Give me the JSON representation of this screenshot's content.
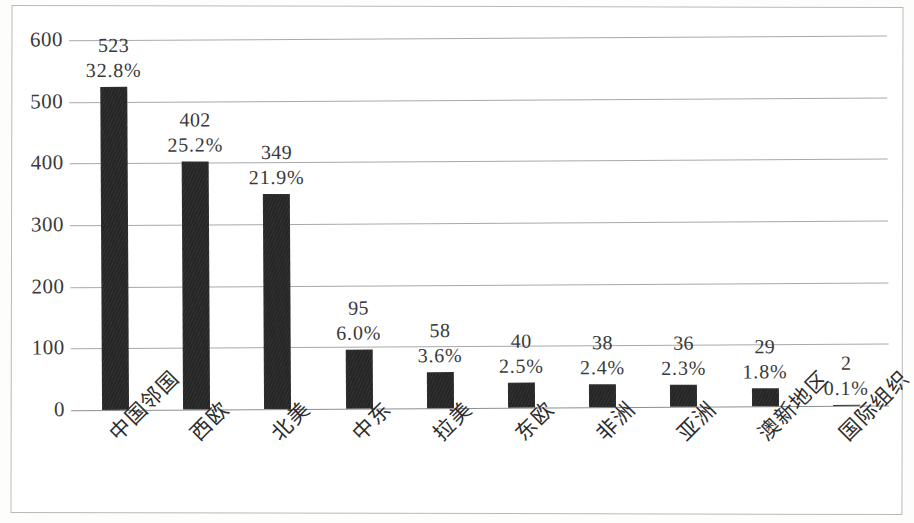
{
  "chart_data": {
    "type": "bar",
    "title": "",
    "subtitle": "",
    "xlabel": "",
    "ylabel": "",
    "ylim": [
      0,
      600
    ],
    "y_ticks": [
      "0",
      "100",
      "200",
      "300",
      "400",
      "500",
      "600"
    ],
    "grid": true,
    "legend": "none",
    "bar_color": "#262626",
    "gridline_color": "#a9a9ab",
    "categories": [
      "中国邻国",
      "西欧",
      "北美",
      "中东",
      "拉美",
      "东欧",
      "非洲",
      "亚洲",
      "澳新地区",
      "国际组织"
    ],
    "values": [
      523,
      402,
      349,
      95,
      58,
      40,
      38,
      36,
      29,
      2
    ],
    "value_labels": [
      "523",
      "402",
      "349",
      "95",
      "58",
      "40",
      "38",
      "36",
      "29",
      "2"
    ],
    "percent_labels": [
      "32.8%",
      "25.2%",
      "21.9%",
      "6.0%",
      "3.6%",
      "2.5%",
      "2.4%",
      "2.3%",
      "1.8%",
      "0.1%"
    ],
    "percents": [
      32.8,
      25.2,
      21.9,
      6.0,
      3.6,
      2.5,
      2.4,
      2.3,
      1.8,
      0.1
    ]
  }
}
